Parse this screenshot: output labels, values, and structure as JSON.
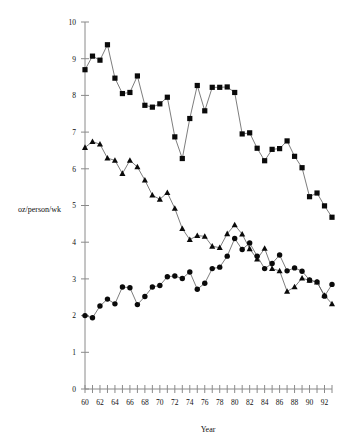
{
  "chart_data": {
    "type": "line",
    "title": "",
    "xlabel": "Year",
    "ylabel": "oz/person/wk",
    "xlim": [
      60,
      93
    ],
    "ylim": [
      0,
      10
    ],
    "grid": false,
    "legend": "none",
    "x_tick_labels": [
      "60",
      "62",
      "64",
      "66",
      "68",
      "70",
      "72",
      "74",
      "76",
      "78",
      "80",
      "82",
      "84",
      "86",
      "88",
      "90",
      "92"
    ],
    "x_tick_values": [
      60,
      62,
      64,
      66,
      68,
      70,
      72,
      74,
      76,
      78,
      80,
      82,
      84,
      86,
      88,
      90,
      92
    ],
    "x_minor_ticks": [
      60,
      61,
      62,
      63,
      64,
      65,
      66,
      67,
      68,
      69,
      70,
      71,
      72,
      73,
      74,
      75,
      76,
      77,
      78,
      79,
      80,
      81,
      82,
      83,
      84,
      85,
      86,
      87,
      88,
      89,
      90,
      91,
      92,
      93
    ],
    "y_tick_labels": [
      "0",
      "1",
      "2",
      "3",
      "4",
      "5",
      "6",
      "7",
      "8",
      "9",
      "10"
    ],
    "y_tick_values": [
      0,
      1,
      2,
      3,
      4,
      5,
      6,
      7,
      8,
      9,
      10
    ],
    "x": [
      60,
      61,
      62,
      63,
      64,
      65,
      66,
      67,
      68,
      69,
      70,
      71,
      72,
      73,
      74,
      75,
      76,
      77,
      78,
      79,
      80,
      81,
      82,
      83,
      84,
      85,
      86,
      87,
      88,
      89,
      90,
      91,
      92,
      93
    ],
    "series": [
      {
        "name": "square-series",
        "marker": "square",
        "color": "#0a0a0a",
        "values": [
          8.7,
          9.07,
          8.96,
          9.38,
          8.47,
          8.05,
          8.08,
          8.53,
          7.73,
          7.68,
          7.77,
          7.95,
          6.87,
          6.28,
          7.37,
          8.27,
          7.58,
          8.22,
          8.22,
          8.23,
          8.08,
          6.95,
          6.98,
          6.56,
          6.22,
          6.53,
          6.55,
          6.76,
          6.34,
          6.03,
          5.24,
          5.34,
          4.99,
          4.68
        ]
      },
      {
        "name": "triangle-series",
        "marker": "triangle",
        "color": "#0a0a0a",
        "values": [
          6.58,
          6.74,
          6.67,
          6.29,
          6.23,
          5.87,
          6.23,
          6.05,
          5.69,
          5.28,
          5.17,
          5.35,
          4.92,
          4.37,
          4.07,
          4.18,
          4.16,
          3.89,
          3.85,
          4.23,
          4.47,
          4.22,
          3.82,
          3.54,
          3.83,
          3.28,
          3.22,
          2.66,
          2.78,
          3.02,
          2.96,
          2.91,
          2.55,
          2.32
        ]
      },
      {
        "name": "circle-series",
        "marker": "circle",
        "color": "#0a0a0a",
        "values": [
          2.0,
          1.94,
          2.26,
          2.45,
          2.32,
          2.78,
          2.76,
          2.3,
          2.52,
          2.78,
          2.82,
          3.06,
          3.08,
          3.01,
          3.19,
          2.72,
          2.88,
          3.28,
          3.32,
          3.62,
          4.1,
          3.8,
          3.98,
          3.62,
          3.28,
          3.42,
          3.65,
          3.22,
          3.3,
          3.21,
          2.97,
          2.92,
          2.53,
          2.85
        ]
      }
    ]
  }
}
